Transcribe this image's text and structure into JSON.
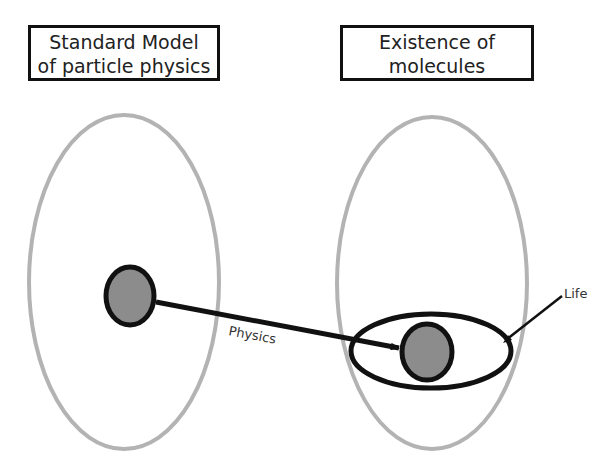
{
  "titles": {
    "left": {
      "line1": "Standard Model",
      "line2": "of particle physics"
    },
    "right": {
      "line1": "Existence of",
      "line2": "molecules"
    }
  },
  "labels": {
    "arrow": "Physics",
    "pointer": "Life"
  },
  "colors": {
    "outer_ellipse": "#b3b3b3",
    "node_fill": "#8c8c8c",
    "stroke": "#111111",
    "background": "#ffffff"
  },
  "shapes": {
    "left_universe": {
      "cx": 124,
      "cy": 282,
      "rx": 95,
      "ry": 167
    },
    "right_universe": {
      "cx": 432,
      "cy": 283,
      "rx": 95,
      "ry": 166
    },
    "left_node": {
      "cx": 130,
      "cy": 296,
      "rx": 25,
      "ry": 30
    },
    "right_node": {
      "cx": 427,
      "cy": 352,
      "rx": 26,
      "ry": 29
    },
    "life_region": {
      "cx": 431,
      "cy": 351,
      "rx": 81,
      "ry": 38
    }
  }
}
